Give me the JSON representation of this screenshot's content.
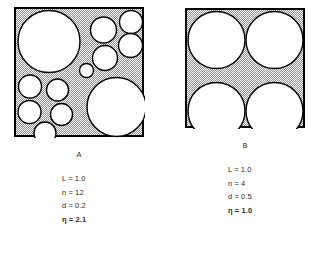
{
  "figure": {
    "background_color": "#ffffff",
    "stipple_color": "#8f8f8f",
    "circle_fill": "#ffffff",
    "outline_color": "#000000"
  },
  "panels": [
    {
      "id": "A",
      "caption": "A",
      "box": {
        "x": 15,
        "y": 8,
        "size": 128,
        "stroke": 2
      },
      "circles": [
        {
          "cx": 49.0,
          "cy": 41.5,
          "r": 31.0
        },
        {
          "cx": 116.5,
          "cy": 107.0,
          "r": 29.5
        },
        {
          "cx": 103.5,
          "cy": 30.0,
          "r": 13.0
        },
        {
          "cx": 131.0,
          "cy": 22.0,
          "r": 11.5
        },
        {
          "cx": 130.5,
          "cy": 45.5,
          "r": 12.0
        },
        {
          "cx": 105.0,
          "cy": 58.0,
          "r": 12.5
        },
        {
          "cx": 30.0,
          "cy": 86.5,
          "r": 11.5
        },
        {
          "cx": 57.5,
          "cy": 90.0,
          "r": 11.0
        },
        {
          "cx": 29.5,
          "cy": 112.0,
          "r": 11.5
        },
        {
          "cx": 61.5,
          "cy": 114.5,
          "r": 11.0
        },
        {
          "cx": 45.0,
          "cy": 133.0,
          "r": 11.0
        },
        {
          "cx": 86.5,
          "cy": 70.5,
          "r": 7.0
        }
      ],
      "params": [
        {
          "symbol": "L",
          "value": "1.0",
          "bold": false
        },
        {
          "symbol": "n",
          "value": "12",
          "bold": false
        },
        {
          "symbol": "d",
          "value": "0.2",
          "bold": false
        },
        {
          "symbol": "η",
          "value": "2.1",
          "bold": true
        }
      ],
      "params_text": {
        "L": "L = 1.0",
        "n": "n = 12",
        "d": "d = 0.2",
        "eta": "η = 2.1"
      }
    },
    {
      "id": "B",
      "caption": "B",
      "box": {
        "x": 186,
        "y": 9,
        "size": 118,
        "stroke": 2
      },
      "circles": [
        {
          "cx": 216.5,
          "cy": 40.0,
          "r": 28.5
        },
        {
          "cx": 274.5,
          "cy": 40.0,
          "r": 28.5
        },
        {
          "cx": 216.5,
          "cy": 111.0,
          "r": 28.5
        },
        {
          "cx": 274.5,
          "cy": 111.0,
          "r": 28.5
        }
      ],
      "params": [
        {
          "symbol": "L",
          "value": "1.0",
          "bold": false
        },
        {
          "symbol": "n",
          "value": "4",
          "bold": false
        },
        {
          "symbol": "d",
          "value": "0.5",
          "bold": false
        },
        {
          "symbol": "η",
          "value": "1.0",
          "bold": true
        }
      ],
      "params_text": {
        "L": "L = 1.0",
        "n": "n = 4",
        "d": "d = 0.5",
        "eta": "η = 1.0"
      }
    }
  ]
}
